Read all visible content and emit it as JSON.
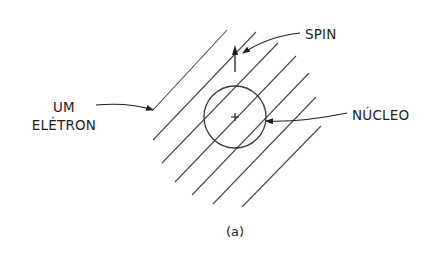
{
  "diagram": {
    "type": "physics-illustration",
    "caption": "(a)",
    "labels": {
      "spin": "SPIN",
      "electron_line1": "UM",
      "electron_line2": "ELÉTRON",
      "nucleus": "NÚCLEO"
    },
    "colors": {
      "line": "#4a4a4a",
      "text": "#1e1e1e",
      "background": "#ffffff"
    },
    "elements": {
      "field_lines_count": 7,
      "nucleus_center": [
        235,
        117
      ],
      "nucleus_radius": 31,
      "center_mark": "+",
      "spin_arrow_direction": "up"
    }
  }
}
